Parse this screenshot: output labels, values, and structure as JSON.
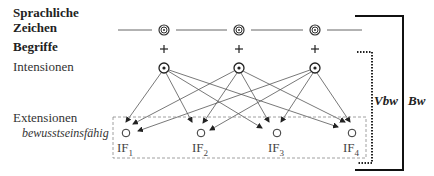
{
  "labels": {
    "sprachliche": "Sprachliche",
    "zeichen": "Zeichen",
    "begriffe": "Begriffe",
    "intensionen": "Intensionen",
    "extensionen": "Extensionen",
    "bewusstseinsfaehig": "bewusstseinsfähig",
    "vbw": "Vbw",
    "bw": "Bw"
  },
  "sign_nodes": [
    {
      "symbol": "concentric-circle"
    },
    {
      "symbol": "concentric-circle"
    },
    {
      "symbol": "concentric-circle"
    }
  ],
  "plus_symbol": "+",
  "intension_nodes": [
    {
      "symbol": "dotted-circle"
    },
    {
      "symbol": "dotted-circle"
    },
    {
      "symbol": "dotted-circle"
    }
  ],
  "extension_nodes": [
    {
      "label": "IF",
      "sub": "1"
    },
    {
      "label": "IF",
      "sub": "2"
    },
    {
      "label": "IF",
      "sub": "3"
    },
    {
      "label": "IF",
      "sub": "4"
    }
  ],
  "colors": {
    "line": "#555555",
    "bracket": "#111111",
    "dashed_box": "#888888"
  }
}
